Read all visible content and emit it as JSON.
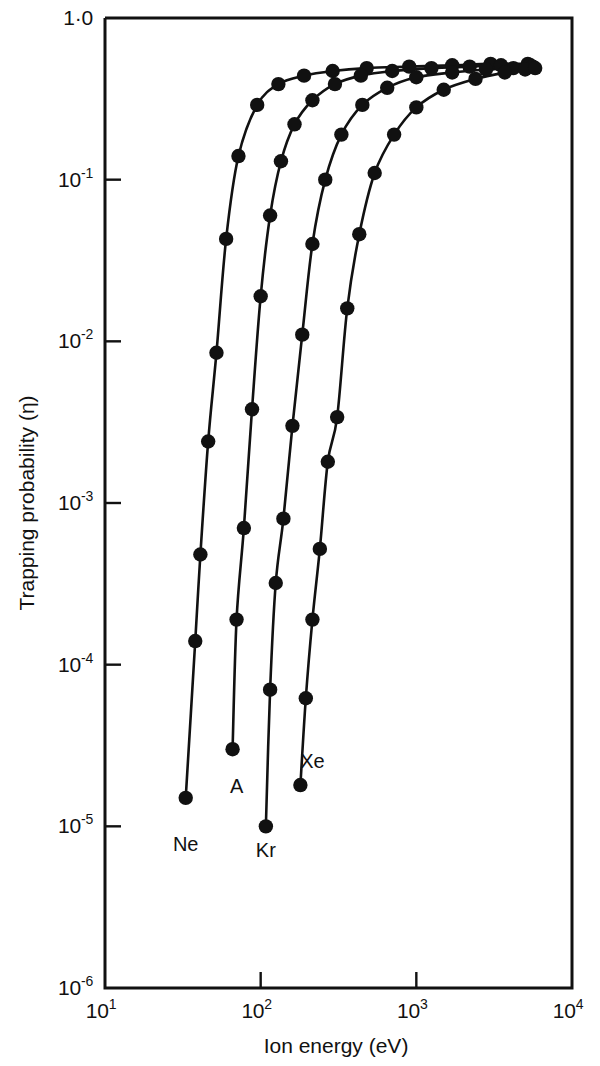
{
  "chart_data": {
    "type": "line",
    "title": "",
    "xlabel": "Ion energy (eV)",
    "ylabel": "Trapping probability (η)",
    "xscale": "log",
    "yscale": "log",
    "xlim": [
      10,
      10000
    ],
    "ylim": [
      1e-06,
      1.0
    ],
    "grid": false,
    "legend_position": "inline-curve-end",
    "xticks": [
      {
        "value": 10,
        "label": "10",
        "exponent": "1"
      },
      {
        "value": 100,
        "label": "10",
        "exponent": "2"
      },
      {
        "value": 1000,
        "label": "10",
        "exponent": "3"
      },
      {
        "value": 10000,
        "label": "10",
        "exponent": "4"
      }
    ],
    "yticks": [
      {
        "value": 1.0,
        "label": "1·0",
        "exponent": ""
      },
      {
        "value": 0.1,
        "label": "10",
        "exponent": "-1"
      },
      {
        "value": 0.01,
        "label": "10",
        "exponent": "-2"
      },
      {
        "value": 0.001,
        "label": "10",
        "exponent": "-3"
      },
      {
        "value": 0.0001,
        "label": "10",
        "exponent": "-4"
      },
      {
        "value": 1e-05,
        "label": "10",
        "exponent": "-5"
      },
      {
        "value": 1e-06,
        "label": "10",
        "exponent": "-6"
      }
    ],
    "series": [
      {
        "name": "Ne",
        "label": "Ne",
        "label_x": 33,
        "label_y": 7e-06,
        "x": [
          33,
          38,
          41,
          46,
          52,
          60,
          72,
          95,
          130,
          190,
          290,
          480,
          900,
          1700,
          3000,
          5200
        ],
        "y": [
          1.5e-05,
          0.00014,
          0.00048,
          0.0024,
          0.0085,
          0.043,
          0.14,
          0.29,
          0.39,
          0.44,
          0.47,
          0.49,
          0.5,
          0.51,
          0.52,
          0.52
        ]
      },
      {
        "name": "A",
        "label": "A",
        "label_x": 70,
        "label_y": 1.6e-05,
        "x": [
          66,
          70,
          78,
          88,
          100,
          115,
          135,
          165,
          215,
          300,
          440,
          700,
          1250,
          2200,
          3500,
          5400
        ],
        "y": [
          3e-05,
          0.00019,
          0.0007,
          0.0038,
          0.019,
          0.06,
          0.13,
          0.22,
          0.31,
          0.39,
          0.44,
          0.47,
          0.49,
          0.5,
          0.51,
          0.51
        ]
      },
      {
        "name": "Kr",
        "label": "Kr",
        "label_x": 108,
        "label_y": 6.5e-06,
        "x": [
          108,
          115,
          125,
          140,
          160,
          185,
          215,
          260,
          330,
          450,
          650,
          1000,
          1700,
          2800,
          4200,
          5600
        ],
        "y": [
          1e-05,
          7e-05,
          0.00032,
          0.0008,
          0.003,
          0.011,
          0.04,
          0.1,
          0.19,
          0.29,
          0.37,
          0.43,
          0.46,
          0.48,
          0.49,
          0.5
        ]
      },
      {
        "name": "Xe",
        "label": "Xe",
        "label_x": 215,
        "label_y": 2.3e-05,
        "x": [
          180,
          195,
          215,
          240,
          270,
          310,
          360,
          430,
          540,
          720,
          1000,
          1500,
          2400,
          3700,
          5000,
          5800
        ],
        "y": [
          1.8e-05,
          6.2e-05,
          0.00019,
          0.00052,
          0.0018,
          0.0034,
          0.016,
          0.046,
          0.11,
          0.19,
          0.28,
          0.36,
          0.42,
          0.46,
          0.48,
          0.49
        ]
      }
    ]
  }
}
